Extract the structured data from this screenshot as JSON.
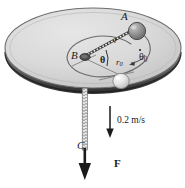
{
  "figure": {
    "background_color": "#ffffff"
  },
  "table": {
    "name": "circular-table",
    "surface_color": "#d8d8d8",
    "edge_color": "#5a5a5a",
    "rim_shadow_color": "#3c3c3c"
  },
  "labels": {
    "point_a": "A",
    "point_b": "B",
    "point_c": "C",
    "radius_r": "r",
    "radius_r0_base": "r",
    "radius_r0_sub": "0",
    "angle_theta": "θ",
    "theta_dot_base": "θ",
    "theta_dot_sub": "0",
    "speed": "0.2 m/s",
    "force": "F"
  },
  "bodies": {
    "ball_a": {
      "name": "ball-a",
      "fill": "#8e8e8e",
      "highlight": "#c9c9c9",
      "stroke": "#4a4a4a"
    },
    "ball_initial": {
      "name": "ball-initial-position",
      "fill": "#e2e2e2",
      "highlight": "#f4f4f4",
      "stroke": "#8a8a8a"
    }
  },
  "vectors": {
    "velocity_arrow": {
      "name": "velocity-arrow",
      "direction": "down",
      "label": "0.2 m/s",
      "color": "#1a1a1a"
    },
    "force_arrow": {
      "name": "force-arrow",
      "direction": "down",
      "label": "F",
      "color": "#1a1a1a"
    }
  },
  "paths": {
    "spiral_orbit": "elliptical path of ball around hole B",
    "cord_on_table": "dashed cord segment from B to A",
    "cord_hanging": "coiled cord hanging from B down through C"
  }
}
